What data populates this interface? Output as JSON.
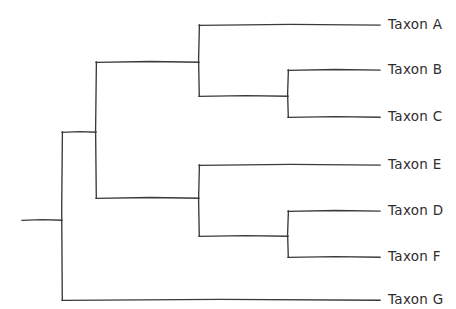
{
  "figure": {
    "kind": "phylogenetic-cladogram",
    "style": "hand-drawn",
    "background_color": "#ffffff",
    "line_color": "#3a3a3a",
    "label_color": "#2e2e2e",
    "width": 456,
    "height": 309
  },
  "tips": [
    {
      "id": "taxon-a",
      "label": "Taxon A",
      "y": 25,
      "branch_start_x": 199,
      "branch_end_x": 380,
      "label_x": 388
    },
    {
      "id": "taxon-b",
      "label": "Taxon B",
      "y": 70,
      "branch_start_x": 288,
      "branch_end_x": 380,
      "label_x": 388
    },
    {
      "id": "taxon-c",
      "label": "Taxon C",
      "y": 117,
      "branch_start_x": 288,
      "branch_end_x": 380,
      "label_x": 388
    },
    {
      "id": "taxon-e",
      "label": "Taxon E",
      "y": 165,
      "branch_start_x": 199,
      "branch_end_x": 380,
      "label_x": 388
    },
    {
      "id": "taxon-d",
      "label": "Taxon D",
      "y": 211,
      "branch_start_x": 288,
      "branch_end_x": 380,
      "label_x": 388
    },
    {
      "id": "taxon-f",
      "label": "Taxon F",
      "y": 257,
      "branch_start_x": 288,
      "branch_end_x": 380,
      "label_x": 388
    },
    {
      "id": "taxon-g",
      "label": "Taxon G",
      "y": 300,
      "branch_start_x": 62,
      "branch_end_x": 380,
      "label_x": 388
    }
  ],
  "nodes": [
    {
      "id": "root-stem",
      "x1": 22,
      "y1": 220,
      "x2": 62,
      "y2": 220
    },
    {
      "id": "root-node",
      "x": 62,
      "y_top": 132,
      "y_bottom": 300
    },
    {
      "id": "clade-abcdef-stem",
      "x1": 62,
      "y1": 132,
      "x2": 96,
      "y2": 132
    },
    {
      "id": "clade-abcdef",
      "x": 96,
      "y_top": 62,
      "y_bottom": 198
    },
    {
      "id": "clade-abc-stem",
      "x1": 96,
      "y1": 62,
      "x2": 199,
      "y2": 62
    },
    {
      "id": "clade-abc",
      "x": 199,
      "y_top": 25,
      "y_bottom": 96
    },
    {
      "id": "clade-bc-stem",
      "x1": 199,
      "y1": 96,
      "x2": 288,
      "y2": 96
    },
    {
      "id": "clade-bc",
      "x": 288,
      "y_top": 70,
      "y_bottom": 117
    },
    {
      "id": "clade-edf-stem",
      "x1": 96,
      "y1": 198,
      "x2": 199,
      "y2": 198
    },
    {
      "id": "clade-edf",
      "x": 199,
      "y_top": 165,
      "y_bottom": 236
    },
    {
      "id": "clade-df-stem",
      "x1": 199,
      "y1": 236,
      "x2": 288,
      "y2": 236
    },
    {
      "id": "clade-df",
      "x": 288,
      "y_top": 211,
      "y_bottom": 257
    }
  ]
}
